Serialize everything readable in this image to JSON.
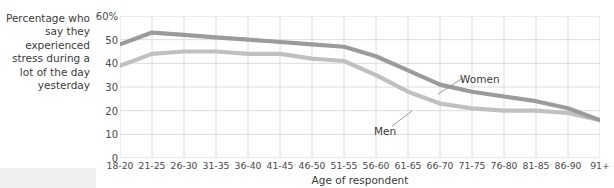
{
  "chart_data": {
    "type": "line",
    "title": "Percentage who\nsay they\nexperienced\nstress during\na lot of the\nday yesterday",
    "xlabel": "Age of respondent",
    "ylabel": "",
    "ylim": [
      0,
      60
    ],
    "yticks": [
      0,
      10,
      20,
      30,
      40,
      50,
      60
    ],
    "ytick_labels": [
      "0",
      "10",
      "20",
      "30",
      "40",
      "50",
      "60%"
    ],
    "grid": true,
    "legend": "inline-annotations",
    "categories": [
      "18-20",
      "21-25",
      "26-30",
      "31-35",
      "36-40",
      "41-45",
      "46-50",
      "51-55",
      "56-60",
      "61-65",
      "66-70",
      "71-75",
      "76-80",
      "81-85",
      "86-90",
      "91+"
    ],
    "series": [
      {
        "name": "Women",
        "color": "#9b9b9b",
        "values": [
          48,
          53,
          52,
          51,
          50,
          49,
          48,
          47,
          43,
          37,
          31,
          28,
          26,
          24,
          21,
          16
        ]
      },
      {
        "name": "Men",
        "color": "#c0c0c0",
        "values": [
          39,
          44,
          45,
          45,
          44,
          44,
          42,
          41,
          35,
          28,
          23,
          21,
          20,
          20,
          19,
          16
        ]
      }
    ],
    "annotations": [
      {
        "text": "Women",
        "series": "Women"
      },
      {
        "text": "Men",
        "series": "Men"
      }
    ]
  },
  "axis": {
    "ytick_labels": [
      "60%",
      "50",
      "40",
      "30",
      "20",
      "10",
      "0"
    ],
    "xtick_labels": [
      "18-20",
      "21-25",
      "26-30",
      "31-35",
      "36-40",
      "41-45",
      "46-50",
      "51-55",
      "56-60",
      "61-65",
      "66-70",
      "71-75",
      "76-80",
      "81-85",
      "86-90",
      "91+"
    ],
    "xlabel": "Age of respondent"
  },
  "caption": {
    "text": "Percentage who say they experienced stress during a lot of the day yesterday"
  },
  "labels": {
    "women": "Women",
    "men": "Men"
  },
  "colors": {
    "women_line": "#9b9b9b",
    "men_line": "#c0c0c0",
    "grid": "#d8d8d8",
    "text": "#3b3b3b"
  }
}
